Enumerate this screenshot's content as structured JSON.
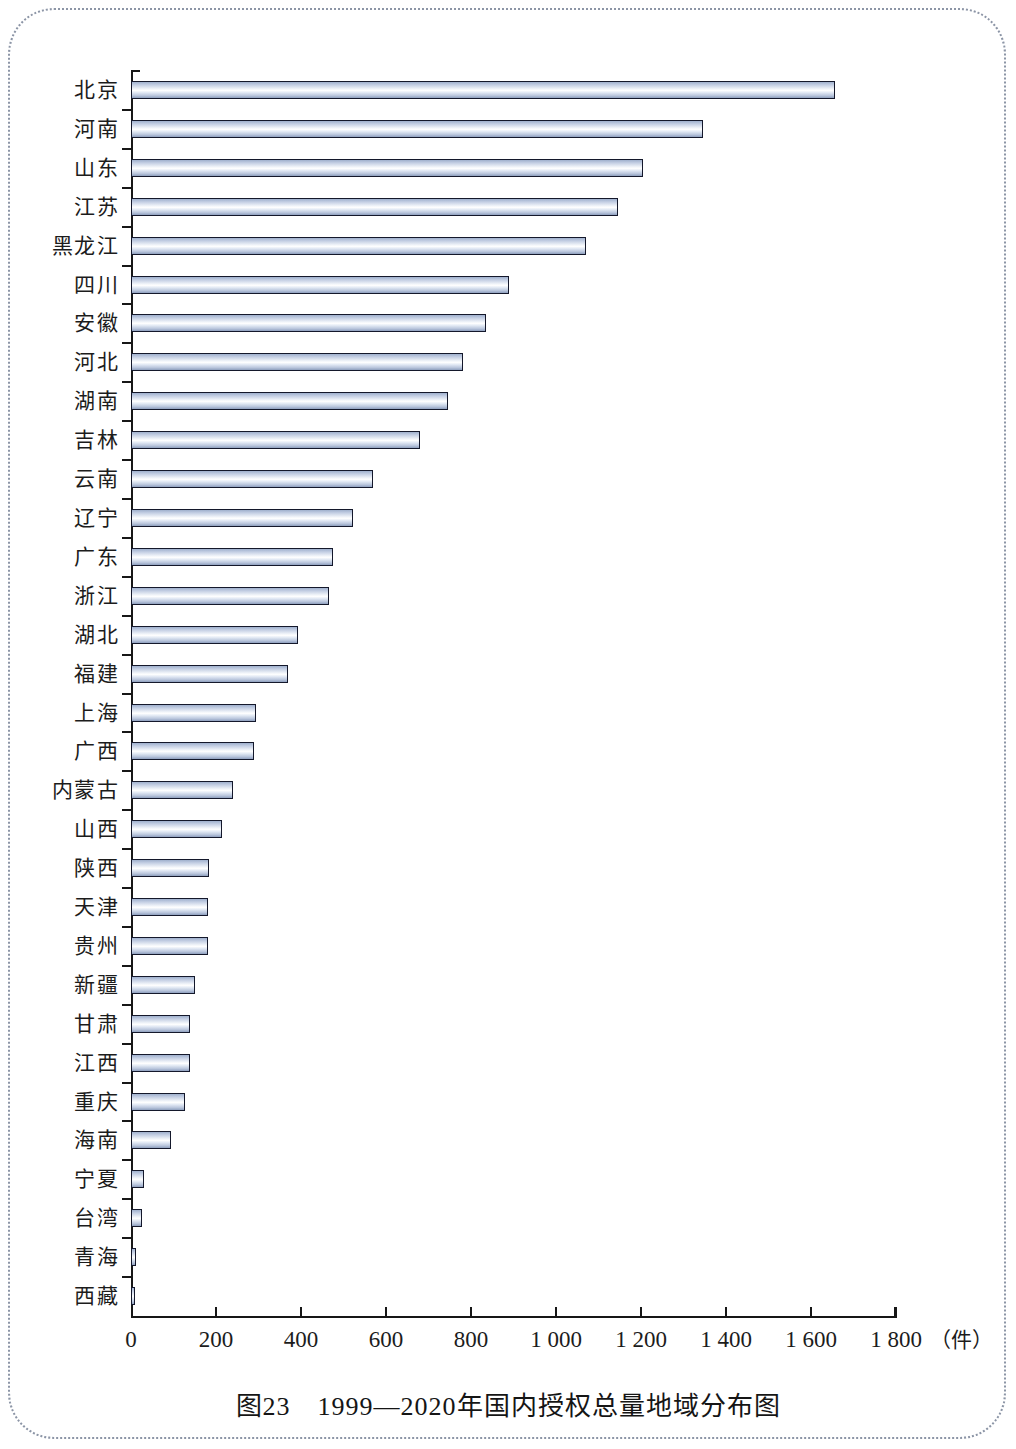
{
  "caption": "图23　1999—2020年国内授权总量地域分布图",
  "axis": {
    "unit": "（件）",
    "ticks": [
      "0",
      "200",
      "400",
      "600",
      "800",
      "1 000",
      "1 200",
      "1 400",
      "1 600",
      "1 800"
    ]
  },
  "chart_data": {
    "type": "bar",
    "orientation": "horizontal",
    "title": "图23　1999—2020年国内授权总量地域分布图",
    "xlabel": "（件）",
    "ylabel": "",
    "xlim": [
      0,
      1800
    ],
    "xticks": [
      0,
      200,
      400,
      600,
      800,
      1000,
      1200,
      1400,
      1600,
      1800
    ],
    "grid": false,
    "legend": null,
    "categories": [
      "北京",
      "河南",
      "山东",
      "江苏",
      "黑龙江",
      "四川",
      "安徽",
      "河北",
      "湖南",
      "吉林",
      "云南",
      "辽宁",
      "广东",
      "浙江",
      "湖北",
      "福建",
      "上海",
      "广西",
      "内蒙古",
      "山西",
      "陕西",
      "天津",
      "贵州",
      "新疆",
      "甘肃",
      "江西",
      "重庆",
      "海南",
      "宁夏",
      "台湾",
      "青海",
      "西藏"
    ],
    "values": [
      1656,
      1345,
      1205,
      1145,
      1070,
      890,
      835,
      780,
      745,
      680,
      570,
      522,
      475,
      465,
      393,
      370,
      295,
      290,
      240,
      215,
      184,
      182,
      180,
      150,
      139,
      138,
      127,
      94,
      30,
      25,
      12,
      5
    ]
  }
}
